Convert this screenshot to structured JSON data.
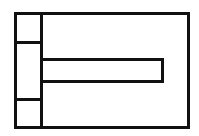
{
  "diagram": {
    "stroke_color": "#111111",
    "background": "#ffffff",
    "shapes": [
      {
        "name": "outer-frame",
        "x": 14,
        "y": 12,
        "w": 176,
        "h": 117
      },
      {
        "name": "left-column",
        "x": 14,
        "y": 12,
        "w": 29,
        "h": 117
      },
      {
        "name": "left-top-cell",
        "x": 14,
        "y": 12,
        "w": 29,
        "h": 32
      },
      {
        "name": "left-bottom-cell",
        "x": 14,
        "y": 98,
        "w": 29,
        "h": 31
      },
      {
        "name": "horizontal-bar",
        "x": 40,
        "y": 58,
        "w": 124,
        "h": 25
      }
    ]
  }
}
